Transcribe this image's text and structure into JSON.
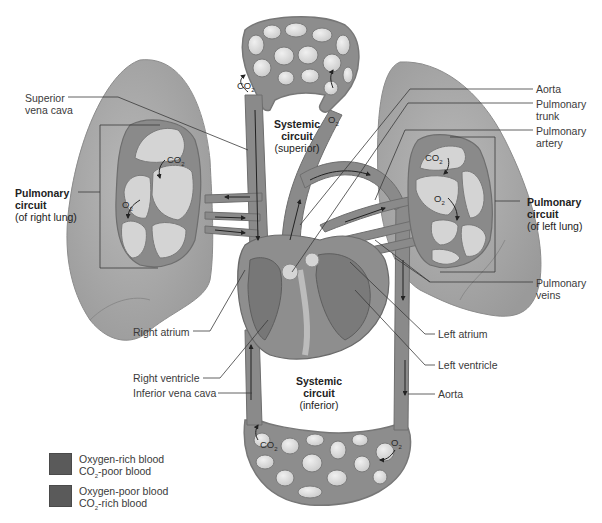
{
  "diagram": {
    "labels_left": {
      "superior_vena_cava": [
        "Superior",
        "vena cava"
      ],
      "pulmonary_circuit_right": {
        "line1": "Pulmonary",
        "line2": "circuit",
        "line3": "(of right lung)"
      },
      "right_atrium": "Right atrium",
      "right_ventricle": "Right ventricle",
      "inferior_vena_cava": "Inferior vena cava"
    },
    "labels_right": {
      "aorta_top": "Aorta",
      "pulmonary_trunk": [
        "Pulmonary",
        "trunk"
      ],
      "pulmonary_artery": [
        "Pulmonary",
        "artery"
      ],
      "pulmonary_circuit_left": {
        "line1": "Pulmonary",
        "line2": "circuit",
        "line3": "(of left lung)"
      },
      "pulmonary_veins": [
        "Pulmonary",
        "veins"
      ],
      "left_atrium": "Left atrium",
      "left_ventricle": "Left ventricle",
      "aorta_bottom": "Aorta"
    },
    "labels_center": {
      "systemic_superior": {
        "line1": "Systemic",
        "line2": "circuit",
        "line3": "(superior)"
      },
      "systemic_inferior": {
        "line1": "Systemic",
        "line2": "circuit",
        "line3": "(inferior)"
      }
    },
    "gas_labels": {
      "co2": "CO",
      "o2": "O",
      "subscript": "2"
    },
    "legend": [
      {
        "line1": "Oxygen-rich blood",
        "line2_pre": "CO",
        "line2_sub": "2",
        "line2_post": "-poor blood",
        "color": "#5e5e5e"
      },
      {
        "line1": "Oxygen-poor blood",
        "line2_pre": "CO",
        "line2_sub": "2",
        "line2_post": "-rich blood",
        "color": "#565656"
      }
    ]
  },
  "colors": {
    "lung": "#a9a9a9",
    "lung_edge": "#8c8c8c",
    "vessel": "#8a8a8a",
    "vessel_dark": "#6a6a6a",
    "alveolus": "#d6d6d6",
    "capillary_cell": "#e2e2e2",
    "leader_line": "#3a3a3a"
  }
}
